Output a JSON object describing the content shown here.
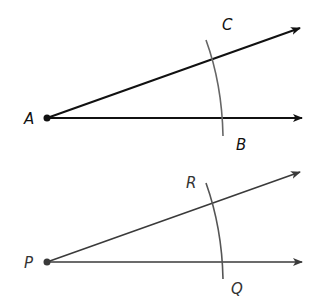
{
  "diagram": {
    "type": "geometric-construction",
    "figures": [
      {
        "name": "original-angle",
        "vertex": {
          "label": "A",
          "x": 47,
          "y": 118
        },
        "ray_upper": {
          "label": "C",
          "end_x": 302,
          "end_y": 27
        },
        "ray_lower": {
          "label": "B",
          "end_x": 304,
          "end_y": 118
        },
        "arc": {
          "start_x": 206,
          "start_y": 40,
          "ctrl_x": 222,
          "ctrl_y": 84,
          "end_x": 223,
          "end_y": 136
        },
        "stroke_color": "#111111",
        "arc_color": "#555555"
      },
      {
        "name": "copied-angle",
        "vertex": {
          "label": "P",
          "x": 47,
          "y": 262
        },
        "ray_upper": {
          "label": "R",
          "end_x": 302,
          "end_y": 171
        },
        "ray_lower": {
          "label": "Q",
          "end_x": 304,
          "end_y": 262
        },
        "arc": {
          "start_x": 206,
          "start_y": 183,
          "ctrl_x": 222,
          "ctrl_y": 228,
          "end_x": 223,
          "end_y": 279
        },
        "stroke_color": "#3a3a3a",
        "arc_color": "#555555"
      }
    ],
    "labels": {
      "A": "A",
      "B": "B",
      "C": "C",
      "P": "P",
      "Q": "Q",
      "R": "R"
    }
  }
}
